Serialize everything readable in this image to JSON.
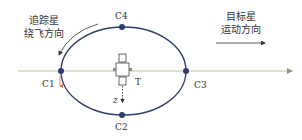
{
  "diagram": {
    "title": "",
    "chaser_direction_label": {
      "line1": "追踪星",
      "line2": "绕飞方向"
    },
    "target_direction_label": {
      "line1": "目标星",
      "line2": "运动方向"
    },
    "points": [
      {
        "id": "C1",
        "label": "C1"
      },
      {
        "id": "C2",
        "label": "C2"
      },
      {
        "id": "C3",
        "label": "C3"
      },
      {
        "id": "C4",
        "label": "C4"
      }
    ],
    "target_label": "T",
    "z_axis_label": "z",
    "colors": {
      "orbit": "#2f3e68",
      "point": "#2f3e68",
      "axis_line": "#b5c0a0",
      "small_arrow": "#e06a4a",
      "text": "#333333"
    }
  }
}
